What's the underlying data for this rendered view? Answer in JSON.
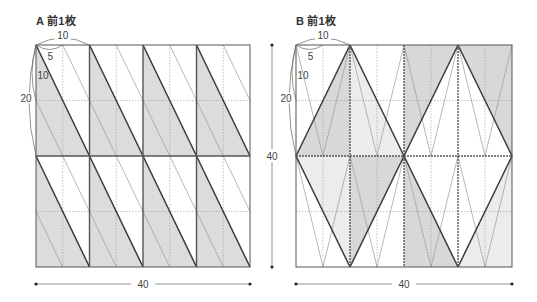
{
  "panels": [
    {
      "id": "A",
      "title": "A 前1枚",
      "pattern": "parallelogram-stripes",
      "grid": {
        "x": 36,
        "y": 45,
        "w": 214,
        "h": 222,
        "cols": 4,
        "rows": 2
      },
      "dims": {
        "top": "10",
        "inner_top": "5",
        "inner_side": "10",
        "side": "20",
        "bottom": "40"
      },
      "fill_color": "#dcdcdc"
    },
    {
      "id": "B",
      "title": "B 前1枚",
      "pattern": "diamond-triangles",
      "grid": {
        "x": 296,
        "y": 45,
        "w": 216,
        "h": 222,
        "cols": 4,
        "rows": 2
      },
      "dims": {
        "top": "10",
        "inner_top": "5",
        "inner_side": "10",
        "side": "20",
        "vertical": "40",
        "bottom": "40"
      },
      "fill_dark": "#d8d8d8",
      "fill_light": "#ececec"
    }
  ],
  "colors": {
    "thick_line": "#3a3a3a",
    "thin_line": "#9a9a9a",
    "frame": "#555555"
  }
}
